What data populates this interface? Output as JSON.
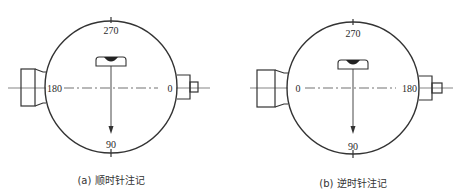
{
  "figures": [
    {
      "id": "a",
      "caption": "(a) 顺时针注记",
      "labels": {
        "top": "270",
        "bottom": "90",
        "left": "180",
        "right": "0"
      },
      "direction": "clockwise"
    },
    {
      "id": "b",
      "caption": "(b) 逆时针注记",
      "labels": {
        "top": "270",
        "bottom": "90",
        "left": "0",
        "right": "180"
      },
      "direction": "counterclockwise"
    }
  ],
  "colors": {
    "stroke": "#333333",
    "background": "#ffffff"
  }
}
